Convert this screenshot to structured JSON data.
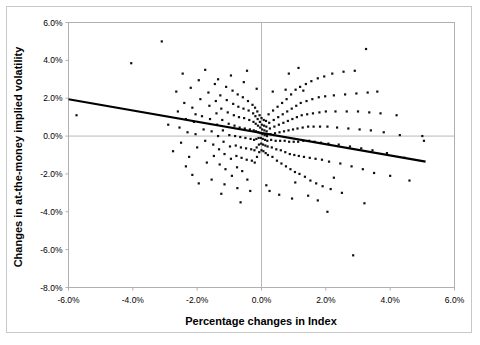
{
  "figure": {
    "background_color": "#ffffff",
    "frame_color": "#c8c8c8",
    "point_color": "#101010",
    "trendline_color": "#000000",
    "axis_color": "#b0b0b0"
  },
  "chart_data": {
    "type": "scatter",
    "title": "",
    "xlabel": "Percentage changes in Index",
    "ylabel": "Changes in at-the-money implied volatility",
    "xlim": [
      -6.0,
      6.0
    ],
    "ylim": [
      -8.0,
      6.0
    ],
    "xticks": [
      -6.0,
      -4.0,
      -2.0,
      0.0,
      2.0,
      4.0,
      6.0
    ],
    "yticks": [
      -8.0,
      -6.0,
      -4.0,
      -2.0,
      0.0,
      2.0,
      4.0,
      6.0
    ],
    "xticklabels": [
      "-6.0%",
      "-4.0%",
      "-2.0%",
      "0.0%",
      "2.0%",
      "4.0%",
      "6.0%"
    ],
    "yticklabels": [
      "-8.0%",
      "-6.0%",
      "-4.0%",
      "-2.0%",
      "0.0%",
      "2.0%",
      "4.0%",
      "6.0%"
    ],
    "grid": false,
    "legend": null,
    "zero_lines": {
      "x": 0.0,
      "y": 0.0
    },
    "trendline": {
      "x_start": -6.0,
      "y_start": 1.95,
      "x_end": 5.1,
      "y_end": -1.35,
      "slope": -0.297,
      "intercept": 0.167
    },
    "points": [
      [
        -5.75,
        1.1
      ],
      [
        -4.05,
        3.85
      ],
      [
        -3.1,
        5.0
      ],
      [
        -2.65,
        2.35
      ],
      [
        -2.6,
        1.3
      ],
      [
        -2.55,
        0.45
      ],
      [
        -2.5,
        -0.35
      ],
      [
        -2.45,
        3.3
      ],
      [
        -2.4,
        1.75
      ],
      [
        -2.35,
        0.9
      ],
      [
        -2.3,
        0.2
      ],
      [
        -2.25,
        -1.1
      ],
      [
        -2.2,
        2.55
      ],
      [
        -2.15,
        1.5
      ],
      [
        -2.1,
        0.75
      ],
      [
        -2.05,
        0.1
      ],
      [
        -2.0,
        -0.6
      ],
      [
        -1.95,
        2.95
      ],
      [
        -1.9,
        1.95
      ],
      [
        -1.85,
        1.05
      ],
      [
        -1.8,
        0.35
      ],
      [
        -1.75,
        -0.25
      ],
      [
        -1.7,
        -1.4
      ],
      [
        -1.65,
        2.3
      ],
      [
        -1.62,
        1.6
      ],
      [
        -1.6,
        0.9
      ],
      [
        -1.55,
        0.25
      ],
      [
        -1.5,
        -0.45
      ],
      [
        -1.48,
        -1.05
      ],
      [
        -1.45,
        2.75
      ],
      [
        -1.42,
        1.85
      ],
      [
        -1.4,
        1.2
      ],
      [
        -1.38,
        0.6
      ],
      [
        -1.35,
        0.0
      ],
      [
        -1.32,
        -0.7
      ],
      [
        -1.3,
        -1.5
      ],
      [
        -1.28,
        2.15
      ],
      [
        -1.25,
        1.45
      ],
      [
        -1.22,
        0.85
      ],
      [
        -1.2,
        0.3
      ],
      [
        -1.18,
        -0.3
      ],
      [
        -1.15,
        -0.95
      ],
      [
        -1.12,
        -1.75
      ],
      [
        -1.1,
        2.6
      ],
      [
        -1.08,
        1.9
      ],
      [
        -1.05,
        1.25
      ],
      [
        -1.02,
        0.65
      ],
      [
        -1.0,
        0.05
      ],
      [
        -0.98,
        -0.55
      ],
      [
        -0.95,
        -1.2
      ],
      [
        -0.92,
        -2.1
      ],
      [
        -0.9,
        2.4
      ],
      [
        -0.88,
        1.7
      ],
      [
        -0.86,
        1.1
      ],
      [
        -0.84,
        0.55
      ],
      [
        -0.82,
        0.0
      ],
      [
        -0.8,
        -0.5
      ],
      [
        -0.78,
        -1.05
      ],
      [
        -0.76,
        -1.65
      ],
      [
        -0.74,
        2.2
      ],
      [
        -0.72,
        1.55
      ],
      [
        -0.7,
        1.0
      ],
      [
        -0.68,
        0.45
      ],
      [
        -0.66,
        -0.05
      ],
      [
        -0.64,
        -0.6
      ],
      [
        -0.62,
        -1.15
      ],
      [
        -0.6,
        -1.85
      ],
      [
        -0.58,
        2.05
      ],
      [
        -0.56,
        1.45
      ],
      [
        -0.54,
        0.95
      ],
      [
        -0.52,
        0.4
      ],
      [
        -0.5,
        -0.1
      ],
      [
        -0.48,
        -0.65
      ],
      [
        -0.46,
        -1.25
      ],
      [
        -0.44,
        -2.3
      ],
      [
        -0.42,
        1.85
      ],
      [
        -0.4,
        1.35
      ],
      [
        -0.38,
        0.85
      ],
      [
        -0.36,
        0.35
      ],
      [
        -0.34,
        -0.15
      ],
      [
        -0.32,
        -0.7
      ],
      [
        -0.3,
        -1.3
      ],
      [
        -0.28,
        1.65
      ],
      [
        -0.26,
        1.2
      ],
      [
        -0.25,
        0.75
      ],
      [
        -0.24,
        0.3
      ],
      [
        -0.23,
        -0.2
      ],
      [
        -0.22,
        -0.75
      ],
      [
        -0.21,
        -1.4
      ],
      [
        -0.2,
        1.5
      ],
      [
        -0.19,
        1.05
      ],
      [
        -0.18,
        0.65
      ],
      [
        -0.17,
        0.25
      ],
      [
        -0.16,
        -0.15
      ],
      [
        -0.15,
        -0.6
      ],
      [
        -0.14,
        -1.1
      ],
      [
        -0.13,
        1.3
      ],
      [
        -0.12,
        0.9
      ],
      [
        -0.11,
        0.55
      ],
      [
        -0.1,
        0.2
      ],
      [
        -0.09,
        -0.1
      ],
      [
        -0.08,
        -0.45
      ],
      [
        -0.07,
        -0.85
      ],
      [
        -0.06,
        1.1
      ],
      [
        -0.05,
        0.75
      ],
      [
        -0.04,
        0.45
      ],
      [
        -0.03,
        0.15
      ],
      [
        -0.02,
        -0.1
      ],
      [
        -0.01,
        -0.4
      ],
      [
        0.0,
        -0.75
      ],
      [
        0.0,
        0.95
      ],
      [
        0.01,
        0.6
      ],
      [
        0.02,
        0.35
      ],
      [
        0.03,
        0.1
      ],
      [
        0.04,
        -0.15
      ],
      [
        0.05,
        -0.45
      ],
      [
        0.06,
        -0.8
      ],
      [
        0.07,
        0.85
      ],
      [
        0.08,
        0.55
      ],
      [
        0.09,
        0.3
      ],
      [
        0.1,
        0.05
      ],
      [
        0.11,
        -0.2
      ],
      [
        0.12,
        -0.5
      ],
      [
        0.13,
        -0.9
      ],
      [
        0.14,
        0.8
      ],
      [
        0.15,
        0.5
      ],
      [
        0.16,
        0.25
      ],
      [
        0.17,
        0.0
      ],
      [
        0.18,
        -0.25
      ],
      [
        0.19,
        -0.55
      ],
      [
        0.2,
        -1.0
      ],
      [
        0.22,
        1.15
      ],
      [
        0.24,
        0.7
      ],
      [
        0.26,
        0.4
      ],
      [
        0.28,
        0.1
      ],
      [
        0.3,
        -0.2
      ],
      [
        0.32,
        -0.6
      ],
      [
        0.34,
        -1.1
      ],
      [
        0.36,
        1.35
      ],
      [
        0.38,
        0.85
      ],
      [
        0.4,
        0.5
      ],
      [
        0.42,
        0.15
      ],
      [
        0.44,
        -0.25
      ],
      [
        0.46,
        -0.7
      ],
      [
        0.48,
        -1.3
      ],
      [
        0.5,
        1.55
      ],
      [
        0.52,
        1.0
      ],
      [
        0.54,
        0.6
      ],
      [
        0.56,
        0.2
      ],
      [
        0.58,
        -0.25
      ],
      [
        0.6,
        -0.75
      ],
      [
        0.62,
        -1.45
      ],
      [
        0.64,
        1.75
      ],
      [
        0.66,
        1.15
      ],
      [
        0.68,
        0.7
      ],
      [
        0.7,
        0.25
      ],
      [
        0.72,
        -0.25
      ],
      [
        0.74,
        -0.85
      ],
      [
        0.76,
        -1.6
      ],
      [
        0.78,
        1.95
      ],
      [
        0.8,
        1.3
      ],
      [
        0.82,
        0.8
      ],
      [
        0.84,
        0.3
      ],
      [
        0.86,
        -0.3
      ],
      [
        0.88,
        -0.95
      ],
      [
        0.9,
        -1.75
      ],
      [
        0.92,
        2.2
      ],
      [
        0.94,
        1.45
      ],
      [
        0.96,
        0.9
      ],
      [
        0.98,
        0.35
      ],
      [
        1.0,
        -0.3
      ],
      [
        1.02,
        -1.0
      ],
      [
        1.04,
        -1.9
      ],
      [
        1.06,
        2.45
      ],
      [
        1.08,
        1.6
      ],
      [
        1.1,
        1.0
      ],
      [
        1.12,
        0.4
      ],
      [
        1.14,
        -0.3
      ],
      [
        1.16,
        -1.05
      ],
      [
        1.18,
        -2.0
      ],
      [
        1.2,
        2.6
      ],
      [
        1.22,
        1.75
      ],
      [
        1.25,
        1.1
      ],
      [
        1.28,
        0.45
      ],
      [
        1.3,
        -0.25
      ],
      [
        1.32,
        -1.1
      ],
      [
        1.35,
        -2.15
      ],
      [
        1.38,
        2.75
      ],
      [
        1.4,
        1.85
      ],
      [
        1.42,
        1.15
      ],
      [
        1.45,
        0.5
      ],
      [
        1.48,
        -0.25
      ],
      [
        1.5,
        -1.15
      ],
      [
        1.52,
        -2.35
      ],
      [
        1.55,
        2.9
      ],
      [
        1.58,
        1.95
      ],
      [
        1.6,
        1.2
      ],
      [
        1.62,
        0.5
      ],
      [
        1.65,
        -0.3
      ],
      [
        1.68,
        -1.2
      ],
      [
        1.7,
        -2.5
      ],
      [
        1.75,
        3.05
      ],
      [
        1.78,
        2.05
      ],
      [
        1.8,
        1.25
      ],
      [
        1.82,
        0.5
      ],
      [
        1.85,
        -0.35
      ],
      [
        1.88,
        -1.25
      ],
      [
        1.9,
        -2.65
      ],
      [
        1.95,
        3.15
      ],
      [
        1.98,
        2.1
      ],
      [
        2.0,
        1.3
      ],
      [
        2.05,
        0.5
      ],
      [
        2.08,
        -0.4
      ],
      [
        2.1,
        -1.35
      ],
      [
        2.15,
        -2.8
      ],
      [
        2.2,
        3.3
      ],
      [
        2.25,
        2.15
      ],
      [
        2.3,
        1.3
      ],
      [
        2.35,
        0.45
      ],
      [
        2.4,
        -0.45
      ],
      [
        2.45,
        -1.45
      ],
      [
        2.5,
        -3.0
      ],
      [
        2.55,
        3.4
      ],
      [
        2.6,
        2.2
      ],
      [
        2.65,
        1.3
      ],
      [
        2.7,
        0.4
      ],
      [
        2.75,
        -0.55
      ],
      [
        2.8,
        -1.6
      ],
      [
        2.85,
        -6.3
      ],
      [
        2.9,
        3.45
      ],
      [
        2.95,
        2.25
      ],
      [
        3.0,
        1.3
      ],
      [
        3.05,
        0.35
      ],
      [
        3.1,
        -0.65
      ],
      [
        3.15,
        -1.75
      ],
      [
        3.2,
        -3.55
      ],
      [
        3.25,
        4.6
      ],
      [
        3.3,
        2.3
      ],
      [
        3.35,
        1.25
      ],
      [
        3.4,
        0.3
      ],
      [
        3.45,
        -0.75
      ],
      [
        3.5,
        -1.95
      ],
      [
        3.6,
        2.35
      ],
      [
        3.7,
        1.2
      ],
      [
        3.8,
        0.2
      ],
      [
        3.9,
        -0.9
      ],
      [
        4.0,
        -2.1
      ],
      [
        4.2,
        1.1
      ],
      [
        4.3,
        0.05
      ],
      [
        4.45,
        -1.15
      ],
      [
        4.6,
        -2.35
      ],
      [
        5.0,
        0.0
      ],
      [
        5.05,
        -0.25
      ],
      [
        -2.9,
        0.6
      ],
      [
        -2.75,
        -0.8
      ],
      [
        -2.35,
        -1.6
      ],
      [
        -2.15,
        -2.05
      ],
      [
        -1.95,
        -2.5
      ],
      [
        -1.75,
        3.5
      ],
      [
        -1.55,
        -2.3
      ],
      [
        -1.35,
        3.0
      ],
      [
        -1.15,
        -2.55
      ],
      [
        -0.95,
        3.2
      ],
      [
        -0.75,
        -2.75
      ],
      [
        -0.55,
        2.85
      ],
      [
        -0.35,
        -2.9
      ],
      [
        -0.15,
        2.5
      ],
      [
        0.15,
        -2.6
      ],
      [
        0.35,
        2.35
      ],
      [
        0.55,
        -3.1
      ],
      [
        0.75,
        2.45
      ],
      [
        0.95,
        -3.3
      ],
      [
        1.15,
        3.6
      ],
      [
        1.45,
        -3.15
      ],
      [
        1.75,
        -3.4
      ],
      [
        2.05,
        -4.0
      ],
      [
        0.25,
        -2.9
      ],
      [
        -0.45,
        3.45
      ],
      [
        1.05,
        -2.45
      ],
      [
        -1.25,
        -3.05
      ],
      [
        0.85,
        3.3
      ],
      [
        -0.65,
        -3.5
      ],
      [
        2.25,
        -2.2
      ],
      [
        -2.05,
        1.15
      ],
      [
        1.3,
        2.4
      ]
    ]
  }
}
